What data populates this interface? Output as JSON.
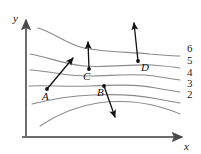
{
  "figure": {
    "background_color": "#ffffff",
    "contour_color": "#8a8a8a",
    "vector_color": "#111111",
    "axis_color": "#6d6d6d"
  },
  "axes": {
    "x_label": "x",
    "y_label": "y",
    "origin": {
      "x": 26,
      "y": 137
    },
    "x_end": {
      "x": 186,
      "y": 137
    },
    "y_end": {
      "x": 26,
      "y": 16
    }
  },
  "chart_data": {
    "type": "line",
    "xlabel": "x",
    "ylabel": "y",
    "grid": false,
    "legend": "none",
    "contour_levels": [
      {
        "label": "6",
        "label_x": 187,
        "label_y": 52,
        "path": "M 38,28 C 55,33 66,44 84,48 C 104,52 130,52 150,54 C 164,55 172,56 180,56"
      },
      {
        "label": "5",
        "label_x": 187,
        "label_y": 64,
        "path": "M 30,54 C 48,57 62,64 84,66 C 106,68 132,64 152,65 C 166,66 174,67 180,68"
      },
      {
        "label": "4",
        "label_x": 187,
        "label_y": 76,
        "path": "M 30,70 C 50,71 64,76 88,76 C 110,76 134,73 154,76 C 166,78 174,79 180,80"
      },
      {
        "label": "3",
        "label_x": 187,
        "label_y": 87,
        "path": "M 29,86 C 50,85 66,87 90,86 C 112,85 136,84 156,88 C 167,90 175,91 180,92"
      },
      {
        "label": "2",
        "label_x": 187,
        "label_y": 98,
        "path": "M 32,104 C 52,99 68,96 92,95 C 114,94 138,95 158,99 C 168,101 175,102 180,103"
      },
      {
        "label": "",
        "label_x": 0,
        "label_y": 0,
        "path": "M 40,126 C 58,114 76,106 98,103 C 120,100 142,102 160,107 C 170,110 176,112 180,114"
      }
    ],
    "points": [
      {
        "name": "A",
        "x": 47,
        "y": 89,
        "label_x": 42,
        "label_y": 100,
        "vector": {
          "tip_x": 73,
          "tip_y": 58,
          "direction": "up-right"
        }
      },
      {
        "name": "B",
        "x": 104,
        "y": 86,
        "label_x": 97,
        "label_y": 96,
        "vector": {
          "tip_x": 115,
          "tip_y": 117,
          "direction": "down-right"
        }
      },
      {
        "name": "C",
        "x": 89,
        "y": 69,
        "label_x": 83,
        "label_y": 80,
        "vector": {
          "tip_x": 88,
          "tip_y": 42,
          "direction": "up"
        }
      },
      {
        "name": "D",
        "x": 138,
        "y": 61,
        "label_x": 141,
        "label_y": 71,
        "vector": {
          "tip_x": 134,
          "tip_y": 23,
          "direction": "up-slight-left"
        }
      }
    ]
  }
}
